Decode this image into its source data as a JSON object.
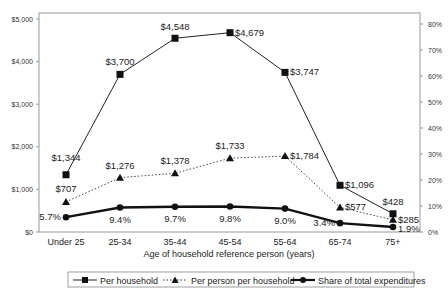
{
  "chart_data": {
    "type": "line",
    "title": "",
    "xlabel": "Age of household reference person (years)",
    "ylabel": "",
    "categories": [
      "Under 25",
      "25-34",
      "35-44",
      "45-54",
      "55-64",
      "65-74",
      "75+"
    ],
    "y_left": {
      "ticks": [
        "$0",
        "$1,000",
        "$2,000",
        "$3,000",
        "$4,000",
        "$5,000"
      ],
      "range": [
        0,
        5000
      ]
    },
    "y_right": {
      "ticks": [
        "0%",
        "10%",
        "20%",
        "30%",
        "40%",
        "50%",
        "60%",
        "70%",
        "80%"
      ],
      "range": [
        0,
        80
      ]
    },
    "grid": false,
    "legend_position": "bottom",
    "series": [
      {
        "name": "Per household",
        "axis": "left",
        "marker": "square",
        "line": "solid-thin",
        "values": [
          1344,
          3700,
          4548,
          4679,
          3747,
          1096,
          428
        ],
        "labels": [
          "$1,344",
          "$3,700",
          "$4,548",
          "$4,679",
          "$3,747",
          "$1,096",
          "$428"
        ]
      },
      {
        "name": "Per person per household",
        "axis": "left",
        "marker": "triangle",
        "line": "dotted",
        "values": [
          707,
          1276,
          1378,
          1733,
          1784,
          577,
          285
        ],
        "labels": [
          "$707",
          "$1,276",
          "$1,378",
          "$1,733",
          "$1,784",
          "$577",
          "$285"
        ]
      },
      {
        "name": "Share of total expenditures",
        "axis": "right",
        "marker": "circle",
        "line": "solid-thick",
        "values": [
          5.7,
          9.4,
          9.7,
          9.8,
          9.0,
          3.4,
          1.9
        ],
        "labels": [
          "5.7%",
          "9.4%",
          "9.7%",
          "9.8%",
          "9.0%",
          "3.4%",
          "1.9%"
        ]
      }
    ]
  }
}
